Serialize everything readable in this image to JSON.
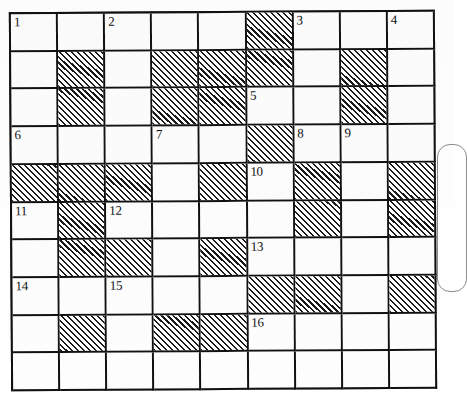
{
  "puzzle": {
    "title": "Crossword Grid",
    "columns": 9,
    "rows": 10,
    "ink_color": "#111111",
    "cell_background": "#fdfdfd",
    "shaded_pattern": "diagonal-hatch",
    "shaded_line_color": "#1a1a1a",
    "clue_numbers": [
      1,
      2,
      3,
      4,
      5,
      6,
      7,
      8,
      9,
      10,
      11,
      12,
      13,
      14,
      15,
      16
    ],
    "cells": [
      [
        {
          "num": "1",
          "shaded": false
        },
        {
          "num": "",
          "shaded": false
        },
        {
          "num": "2",
          "shaded": false
        },
        {
          "num": "",
          "shaded": false
        },
        {
          "num": "",
          "shaded": false
        },
        {
          "num": "",
          "shaded": true
        },
        {
          "num": "3",
          "shaded": false
        },
        {
          "num": "",
          "shaded": false
        },
        {
          "num": "4",
          "shaded": false
        }
      ],
      [
        {
          "num": "",
          "shaded": false
        },
        {
          "num": "",
          "shaded": true
        },
        {
          "num": "",
          "shaded": false
        },
        {
          "num": "",
          "shaded": true
        },
        {
          "num": "",
          "shaded": true
        },
        {
          "num": "",
          "shaded": true
        },
        {
          "num": "",
          "shaded": false
        },
        {
          "num": "",
          "shaded": true
        },
        {
          "num": "",
          "shaded": false
        }
      ],
      [
        {
          "num": "",
          "shaded": false
        },
        {
          "num": "",
          "shaded": true
        },
        {
          "num": "",
          "shaded": false
        },
        {
          "num": "",
          "shaded": true
        },
        {
          "num": "",
          "shaded": true
        },
        {
          "num": "5",
          "shaded": false
        },
        {
          "num": "",
          "shaded": false
        },
        {
          "num": "",
          "shaded": true
        },
        {
          "num": "",
          "shaded": false
        }
      ],
      [
        {
          "num": "6",
          "shaded": false
        },
        {
          "num": "",
          "shaded": false
        },
        {
          "num": "",
          "shaded": false
        },
        {
          "num": "7",
          "shaded": false
        },
        {
          "num": "",
          "shaded": false
        },
        {
          "num": "",
          "shaded": true
        },
        {
          "num": "8",
          "shaded": false
        },
        {
          "num": "9",
          "shaded": false
        },
        {
          "num": "",
          "shaded": false
        }
      ],
      [
        {
          "num": "",
          "shaded": true
        },
        {
          "num": "",
          "shaded": true
        },
        {
          "num": "",
          "shaded": true
        },
        {
          "num": "",
          "shaded": false
        },
        {
          "num": "",
          "shaded": true
        },
        {
          "num": "10",
          "shaded": false
        },
        {
          "num": "",
          "shaded": true
        },
        {
          "num": "",
          "shaded": false
        },
        {
          "num": "",
          "shaded": true
        }
      ],
      [
        {
          "num": "11",
          "shaded": false
        },
        {
          "num": "",
          "shaded": true
        },
        {
          "num": "12",
          "shaded": false
        },
        {
          "num": "",
          "shaded": false
        },
        {
          "num": "",
          "shaded": false
        },
        {
          "num": "",
          "shaded": false
        },
        {
          "num": "",
          "shaded": true
        },
        {
          "num": "",
          "shaded": false
        },
        {
          "num": "",
          "shaded": true
        }
      ],
      [
        {
          "num": "",
          "shaded": false
        },
        {
          "num": "",
          "shaded": true
        },
        {
          "num": "",
          "shaded": true
        },
        {
          "num": "",
          "shaded": false
        },
        {
          "num": "",
          "shaded": true
        },
        {
          "num": "13",
          "shaded": false
        },
        {
          "num": "",
          "shaded": false
        },
        {
          "num": "",
          "shaded": false
        },
        {
          "num": "",
          "shaded": false
        }
      ],
      [
        {
          "num": "14",
          "shaded": false
        },
        {
          "num": "",
          "shaded": false
        },
        {
          "num": "15",
          "shaded": false
        },
        {
          "num": "",
          "shaded": false
        },
        {
          "num": "",
          "shaded": false
        },
        {
          "num": "",
          "shaded": true
        },
        {
          "num": "",
          "shaded": true
        },
        {
          "num": "",
          "shaded": false
        },
        {
          "num": "",
          "shaded": true
        }
      ],
      [
        {
          "num": "",
          "shaded": false
        },
        {
          "num": "",
          "shaded": true
        },
        {
          "num": "",
          "shaded": false
        },
        {
          "num": "",
          "shaded": true
        },
        {
          "num": "",
          "shaded": true
        },
        {
          "num": "16",
          "shaded": false
        },
        {
          "num": "",
          "shaded": false
        },
        {
          "num": "",
          "shaded": false
        },
        {
          "num": "",
          "shaded": false
        }
      ]
    ]
  }
}
